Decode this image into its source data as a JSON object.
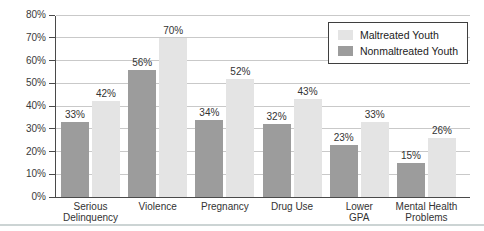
{
  "figure": {
    "background": "#ffffff",
    "bottom_rule_color": "#ccd4d4",
    "axis_color": "#4a4a4a",
    "grid_color": "#c9c9c9",
    "text_color": "#333333"
  },
  "chart_data": {
    "type": "bar",
    "title": "",
    "xlabel": "",
    "ylabel": "",
    "ylim": [
      0,
      80
    ],
    "ytick_step": 10,
    "yticks": [
      "0%",
      "10%",
      "20%",
      "30%",
      "40%",
      "50%",
      "60%",
      "70%",
      "80%"
    ],
    "grid": true,
    "legend_position": "top-right",
    "bar_draw_order": [
      1,
      0
    ],
    "categories": [
      {
        "label": "Serious Delinquency",
        "lines": [
          "Serious",
          "Delinquency"
        ]
      },
      {
        "label": "Violence",
        "lines": [
          "Violence"
        ]
      },
      {
        "label": "Pregnancy",
        "lines": [
          "Pregnancy"
        ]
      },
      {
        "label": "Drug Use",
        "lines": [
          "Drug Use"
        ]
      },
      {
        "label": "Lower GPA",
        "lines": [
          "Lower",
          "GPA"
        ]
      },
      {
        "label": "Mental Health Problems",
        "lines": [
          "Mental Health",
          "Problems"
        ]
      }
    ],
    "series": [
      {
        "name": "Maltreated Youth",
        "color": "#e4e4e4",
        "values": [
          42,
          70,
          52,
          43,
          33,
          26
        ],
        "labels": [
          "42%",
          "70%",
          "52%",
          "43%",
          "33%",
          "26%"
        ]
      },
      {
        "name": "Nonmaltreated Youth",
        "color": "#9c9c9c",
        "values": [
          33,
          56,
          34,
          32,
          23,
          15
        ],
        "labels": [
          "33%",
          "56%",
          "34%",
          "32%",
          "23%",
          "15%"
        ]
      }
    ]
  }
}
